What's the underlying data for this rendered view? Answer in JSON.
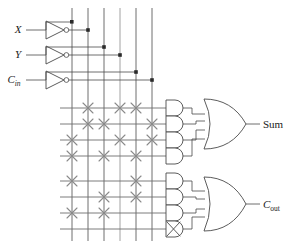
{
  "figure": {
    "kind": "pla-full-adder-schematic",
    "background": "#ffffff",
    "line_color": "#4a4a4a",
    "cross_color": "#808080",
    "text_color": "#1a1a1a"
  },
  "inputs": [
    {
      "id": "x",
      "label": "X",
      "subscript": "",
      "y": 30
    },
    {
      "id": "y",
      "label": "Y",
      "subscript": "",
      "y": 55
    },
    {
      "id": "cin",
      "label": "C",
      "subscript": "in",
      "y": 80
    }
  ],
  "inverters": [
    {
      "id": "inv-x",
      "name": "inverter-x"
    },
    {
      "id": "inv-y",
      "name": "inverter-y"
    },
    {
      "id": "inv-cin",
      "name": "inverter-cin"
    }
  ],
  "vertical_lines": [
    {
      "id": "vl-x",
      "x": 72,
      "signal": "X"
    },
    {
      "id": "vl-xn",
      "x": 88,
      "signal": "X'"
    },
    {
      "id": "vl-y",
      "x": 104,
      "signal": "Y"
    },
    {
      "id": "vl-yn",
      "x": 120,
      "signal": "Y'"
    },
    {
      "id": "vl-c",
      "x": 136,
      "signal": "Cin"
    },
    {
      "id": "vl-cn",
      "x": 152,
      "signal": "Cin'"
    }
  ],
  "and_rows_sum": [
    {
      "id": "sum-row-1",
      "y": 108,
      "crosses_at": [
        88,
        120,
        136
      ]
    },
    {
      "id": "sum-row-2",
      "y": 124,
      "crosses_at": [
        88,
        104,
        152
      ]
    },
    {
      "id": "sum-row-3",
      "y": 140,
      "crosses_at": [
        72,
        120,
        152
      ]
    },
    {
      "id": "sum-row-4",
      "y": 156,
      "crosses_at": [
        72,
        104,
        136
      ]
    }
  ],
  "and_rows_cout": [
    {
      "id": "cout-row-1",
      "y": 181,
      "crosses_at": [
        72,
        136
      ]
    },
    {
      "id": "cout-row-2",
      "y": 197,
      "crosses_at": [
        104,
        136
      ]
    },
    {
      "id": "cout-row-3",
      "y": 213,
      "crosses_at": [
        72,
        104
      ]
    },
    {
      "id": "cout-row-4",
      "y": 229,
      "crosses_at": [],
      "disabled": true
    }
  ],
  "or_gates": [
    {
      "id": "or-sum",
      "name": "or-gate-sum",
      "output_label": "Sum",
      "subscript": ""
    },
    {
      "id": "or-cout",
      "name": "or-gate-cout",
      "output_label": "C",
      "subscript": "out"
    }
  ],
  "outputs": [
    {
      "id": "out-sum",
      "label": "Sum",
      "subscript": "",
      "x": 262,
      "y": 124
    },
    {
      "id": "out-cout",
      "label": "C",
      "subscript": "out",
      "x": 262,
      "y": 205
    }
  ],
  "notes": {
    "disabled_gate_marker": "X",
    "disabled_gate_id": "cout-row-4"
  }
}
